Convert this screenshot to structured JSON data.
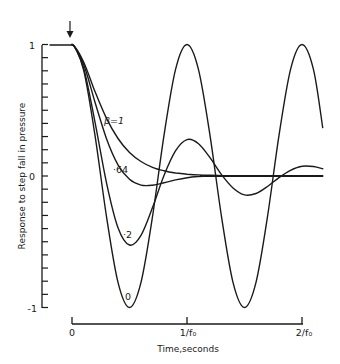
{
  "chart_data": {
    "type": "line",
    "title": "",
    "xlabel": "Time,seconds",
    "ylabel": "Response to step fall in pressure",
    "x_unit": "periods (1/f0)",
    "xlim": [
      0,
      2.2
    ],
    "ylim": [
      -1,
      1
    ],
    "x_ticks": [
      {
        "value": 0,
        "label": "0"
      },
      {
        "value": 1,
        "label": "1/f₀"
      },
      {
        "value": 2,
        "label": "2/f₀"
      }
    ],
    "y_ticks": [
      {
        "value": 1,
        "label": "1"
      },
      {
        "value": 0,
        "label": "0"
      },
      {
        "value": -1,
        "label": "-1"
      }
    ],
    "y_minor_tick_step": 0.1,
    "grid": false,
    "legend": "inline curve labels",
    "annotations": [
      {
        "type": "arrow",
        "text": "",
        "x": 0,
        "y": 1,
        "note": "step applied at t=0"
      }
    ],
    "pre_step": {
      "x": [
        -0.25,
        0
      ],
      "y": [
        1,
        1
      ]
    },
    "x": [
      0,
      0.1,
      0.2,
      0.3,
      0.4,
      0.5,
      0.6,
      0.7,
      0.8,
      0.9,
      1.0,
      1.1,
      1.2,
      1.3,
      1.4,
      1.5,
      1.6,
      1.7,
      1.8,
      1.9,
      2.0,
      2.1,
      2.18
    ],
    "series": [
      {
        "name": "β=1",
        "label": "β=1",
        "beta": 1,
        "values": [
          1,
          0.869,
          0.642,
          0.438,
          0.285,
          0.179,
          0.11,
          0.066,
          0.04,
          0.023,
          0.014,
          0.008,
          0.005,
          0.003,
          0.002,
          0.001,
          0,
          0,
          0,
          0,
          0,
          0,
          0
        ]
      },
      {
        "name": "β=0.64",
        "label": "·64",
        "beta": 0.64,
        "values": [
          1,
          0.851,
          0.561,
          0.284,
          0.085,
          -0.025,
          -0.069,
          -0.07,
          -0.052,
          -0.03,
          -0.013,
          -0.004,
          0,
          0,
          0,
          0,
          0,
          0,
          0,
          0,
          0,
          0,
          0
        ]
      },
      {
        "name": "β=0.2",
        "label": "·2",
        "beta": 0.2,
        "values": [
          1,
          0.824,
          0.409,
          -0.052,
          -0.393,
          -0.525,
          -0.451,
          -0.24,
          0.004,
          0.191,
          0.277,
          0.246,
          0.139,
          0.01,
          -0.091,
          -0.144,
          -0.133,
          -0.08,
          -0.012,
          0.043,
          0.074,
          0.072,
          0.055
        ]
      },
      {
        "name": "β=0",
        "label": "0",
        "beta": 0,
        "values": [
          1,
          0.809,
          0.309,
          -0.309,
          -0.809,
          -1,
          -0.809,
          -0.309,
          0.309,
          0.809,
          1,
          0.809,
          0.309,
          -0.309,
          -0.809,
          -1,
          -0.809,
          -0.309,
          0.309,
          0.809,
          1,
          0.809,
          0.368
        ]
      }
    ],
    "series_label_positions": [
      {
        "series": "β=1",
        "x": 0.33,
        "y": 0.48
      },
      {
        "series": "β=0.64",
        "x": 0.34,
        "y": 0.09
      },
      {
        "series": "β=0.2",
        "x": 0.5,
        "y": -0.44
      },
      {
        "series": "β=0",
        "x": 0.5,
        "y": -0.91
      }
    ]
  },
  "axes": {
    "x_title": "Time,seconds",
    "y_title": "Response to step fall in pressure",
    "y_labels": {
      "top": "1",
      "mid": "0",
      "bottom": "-1"
    },
    "x_labels": {
      "origin": "0",
      "one": "1/f₀",
      "two": "2/f₀"
    }
  },
  "curve_labels": {
    "beta1": "β=1",
    "beta064": "·64",
    "beta02": "·2",
    "beta0": "0"
  }
}
